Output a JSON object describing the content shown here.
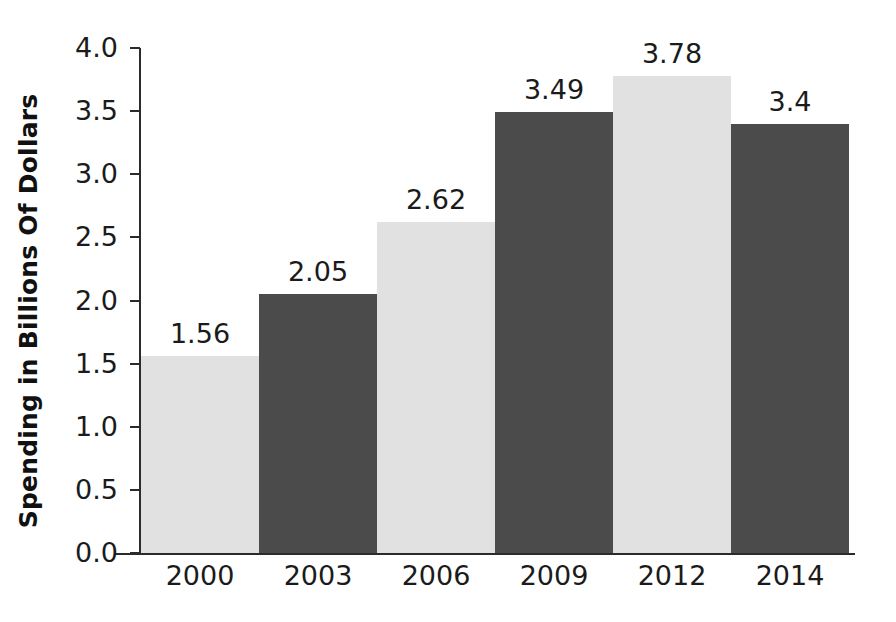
{
  "chart_data": {
    "type": "bar",
    "title": "",
    "subtitle": "",
    "xlabel": "",
    "ylabel": "Spending in Billions Of Dollars",
    "categories": [
      "2000",
      "2003",
      "2006",
      "2009",
      "2012",
      "2014"
    ],
    "values": [
      1.56,
      2.05,
      2.62,
      3.49,
      3.78,
      3.4
    ],
    "value_labels": [
      "1.56",
      "2.05",
      "2.62",
      "3.49",
      "3.78",
      "3.4"
    ],
    "bar_colors": [
      "#e1e1e1",
      "#4b4b4b",
      "#e1e1e1",
      "#4b4b4b",
      "#e1e1e1",
      "#4b4b4b"
    ],
    "ylim": [
      0.0,
      4.0
    ],
    "ytick_labels": [
      "4.0",
      "3.5",
      "3.0",
      "2.5",
      "2.0",
      "1.5",
      "1.0",
      "0.5",
      "0.0"
    ],
    "ytick_values": [
      4.0,
      3.5,
      3.0,
      2.5,
      2.0,
      1.5,
      1.0,
      0.5,
      0.0
    ],
    "grid": false,
    "legend": null,
    "legend_position": "none",
    "annotations": [],
    "series": [
      {
        "name": "Spending",
        "values": [
          1.56,
          2.05,
          2.62,
          3.49,
          3.78,
          3.4
        ]
      }
    ]
  },
  "colors": {
    "background": "#ffffff",
    "axis": "#2b2b2b",
    "text": "#1b1b1b",
    "bar_light": "#e1e1e1",
    "bar_dark": "#4b4b4b"
  }
}
